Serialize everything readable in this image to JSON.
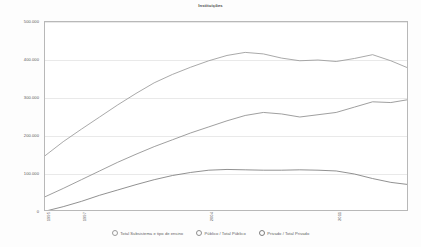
{
  "chart_data": {
    "type": "line",
    "title": "Instituições",
    "xlabel": "",
    "ylabel": "",
    "ylim": [
      0,
      500000
    ],
    "grid": true,
    "legend_position": "bottom",
    "ytick_labels": [
      "500.000",
      "400.000",
      "300.000",
      "200.000",
      "100.000",
      "0"
    ],
    "ytick_values": [
      500000,
      400000,
      300000,
      200000,
      100000,
      0
    ],
    "xtick_labels": [
      "1995",
      "1997",
      "2004",
      "2011"
    ],
    "xtick_values": [
      1995,
      1997,
      2004,
      2011
    ],
    "x": [
      1995,
      1996,
      1997,
      1998,
      1999,
      2000,
      2001,
      2002,
      2003,
      2004,
      2005,
      2006,
      2007,
      2008,
      2009,
      2010,
      2011,
      2012,
      2013,
      2014,
      2015
    ],
    "series": [
      {
        "name": "Total Subsistema e tipo de ensino",
        "color": "#9a9a9a",
        "values": [
          148000,
          185000,
          218000,
          250000,
          282000,
          312000,
          340000,
          362000,
          381000,
          398000,
          412000,
          420000,
          416000,
          405000,
          398000,
          400000,
          396000,
          404000,
          414000,
          398000,
          378000
        ]
      },
      {
        "name": "Público / Total Público",
        "color": "#8e8e8e",
        "values": [
          40000,
          62000,
          85000,
          108000,
          131000,
          152000,
          172000,
          190000,
          208000,
          224000,
          240000,
          254000,
          262000,
          258000,
          250000,
          256000,
          262000,
          276000,
          290000,
          288000,
          296000
        ]
      },
      {
        "name": "Privado / Total Privado",
        "color": "#7d7d7d",
        "values": [
          2000,
          14000,
          28000,
          44000,
          58000,
          72000,
          85000,
          96000,
          104000,
          110000,
          112000,
          111000,
          110000,
          110000,
          111000,
          110000,
          108000,
          100000,
          88000,
          78000,
          72000
        ]
      }
    ]
  },
  "legend": {
    "items": [
      {
        "label": "Total Subsistema e tipo de ensino"
      },
      {
        "label": "Público / Total Público"
      },
      {
        "label": "Privado / Total Privado"
      }
    ]
  }
}
